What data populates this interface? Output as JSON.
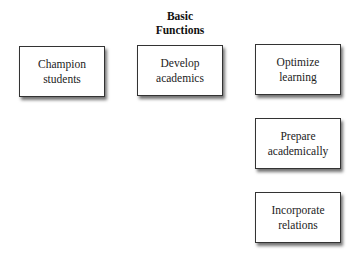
{
  "title": {
    "line1": "Basic",
    "line2": "Functions"
  },
  "boxes": [
    {
      "line1": "Champion",
      "line2": "students"
    },
    {
      "line1": "Develop",
      "line2": "academics"
    },
    {
      "line1": "Optimize",
      "line2": "learning"
    },
    {
      "line1": "Prepare",
      "line2": "academically"
    },
    {
      "line1": "Incorporate",
      "line2": "relations"
    }
  ]
}
